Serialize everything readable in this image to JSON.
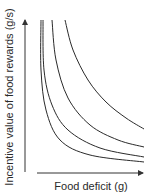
{
  "chart_data": {
    "type": "line",
    "title": "",
    "xlabel": "Food deficit (g)",
    "ylabel": "Incentive value of food rewards (g/s)",
    "grid": false,
    "legend": null,
    "axes_have_ticks": false,
    "series": [
      {
        "name": "curve-1",
        "points": [
          [
            41,
            20
          ],
          [
            41,
            70
          ],
          [
            46,
            110
          ],
          [
            60,
            140
          ],
          [
            90,
            155
          ],
          [
            144,
            162
          ]
        ]
      },
      {
        "name": "curve-2",
        "points": [
          [
            43,
            20
          ],
          [
            44,
            70
          ],
          [
            52,
            105
          ],
          [
            68,
            130
          ],
          [
            100,
            148
          ],
          [
            144,
            157
          ]
        ]
      },
      {
        "name": "curve-3",
        "points": [
          [
            52,
            20
          ],
          [
            56,
            60
          ],
          [
            68,
            98
          ],
          [
            90,
            125
          ],
          [
            118,
            140
          ],
          [
            144,
            147
          ]
        ]
      },
      {
        "name": "curve-4",
        "points": [
          [
            65,
            20
          ],
          [
            73,
            50
          ],
          [
            88,
            80
          ],
          [
            106,
            102
          ],
          [
            126,
            118
          ],
          [
            144,
            129
          ]
        ]
      }
    ]
  },
  "labels": {
    "x": "Food deficit (g)",
    "y": "Incentive value of food rewards (g/s)"
  },
  "colors": {
    "line": "#2a2a2a",
    "axis": "#333333"
  }
}
